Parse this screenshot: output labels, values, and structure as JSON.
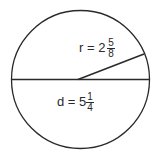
{
  "diagram": {
    "shape": "circle",
    "stroke_color": "#2a2a2a",
    "radius_label": {
      "variable": "r",
      "equals": "=",
      "whole": "2",
      "numerator": "5",
      "denominator": "8",
      "text": "r = 2"
    },
    "diameter_label": {
      "variable": "d",
      "equals": "=",
      "whole": "5",
      "numerator": "1",
      "denominator": "4",
      "text": "d = 5"
    }
  }
}
